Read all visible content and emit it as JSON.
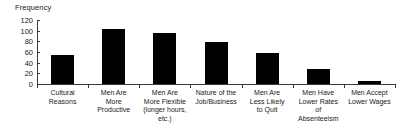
{
  "chart_data": {
    "type": "bar",
    "title": "",
    "xlabel": "",
    "ylabel": "Frequency",
    "ylim": [
      0,
      120
    ],
    "yticks": [
      0,
      20,
      40,
      60,
      80,
      100,
      120
    ],
    "grid": false,
    "legend": false,
    "bar_color": "#000000",
    "axis_color": "#3a3a3a",
    "categories": [
      "Cultural\nReasons",
      "Men Are\nMore\nProductive",
      "Men Are\nMore Flexible\n(longer hours,\netc.)",
      "Nature of the\nJob/Business",
      "Men Are\nLess Likely\nto Quit",
      "Men Have\nLower Rates\nof\nAbsenteeism",
      "Men Accept\nLower Wages"
    ],
    "values": [
      55,
      103,
      96,
      79,
      59,
      29,
      5
    ]
  }
}
